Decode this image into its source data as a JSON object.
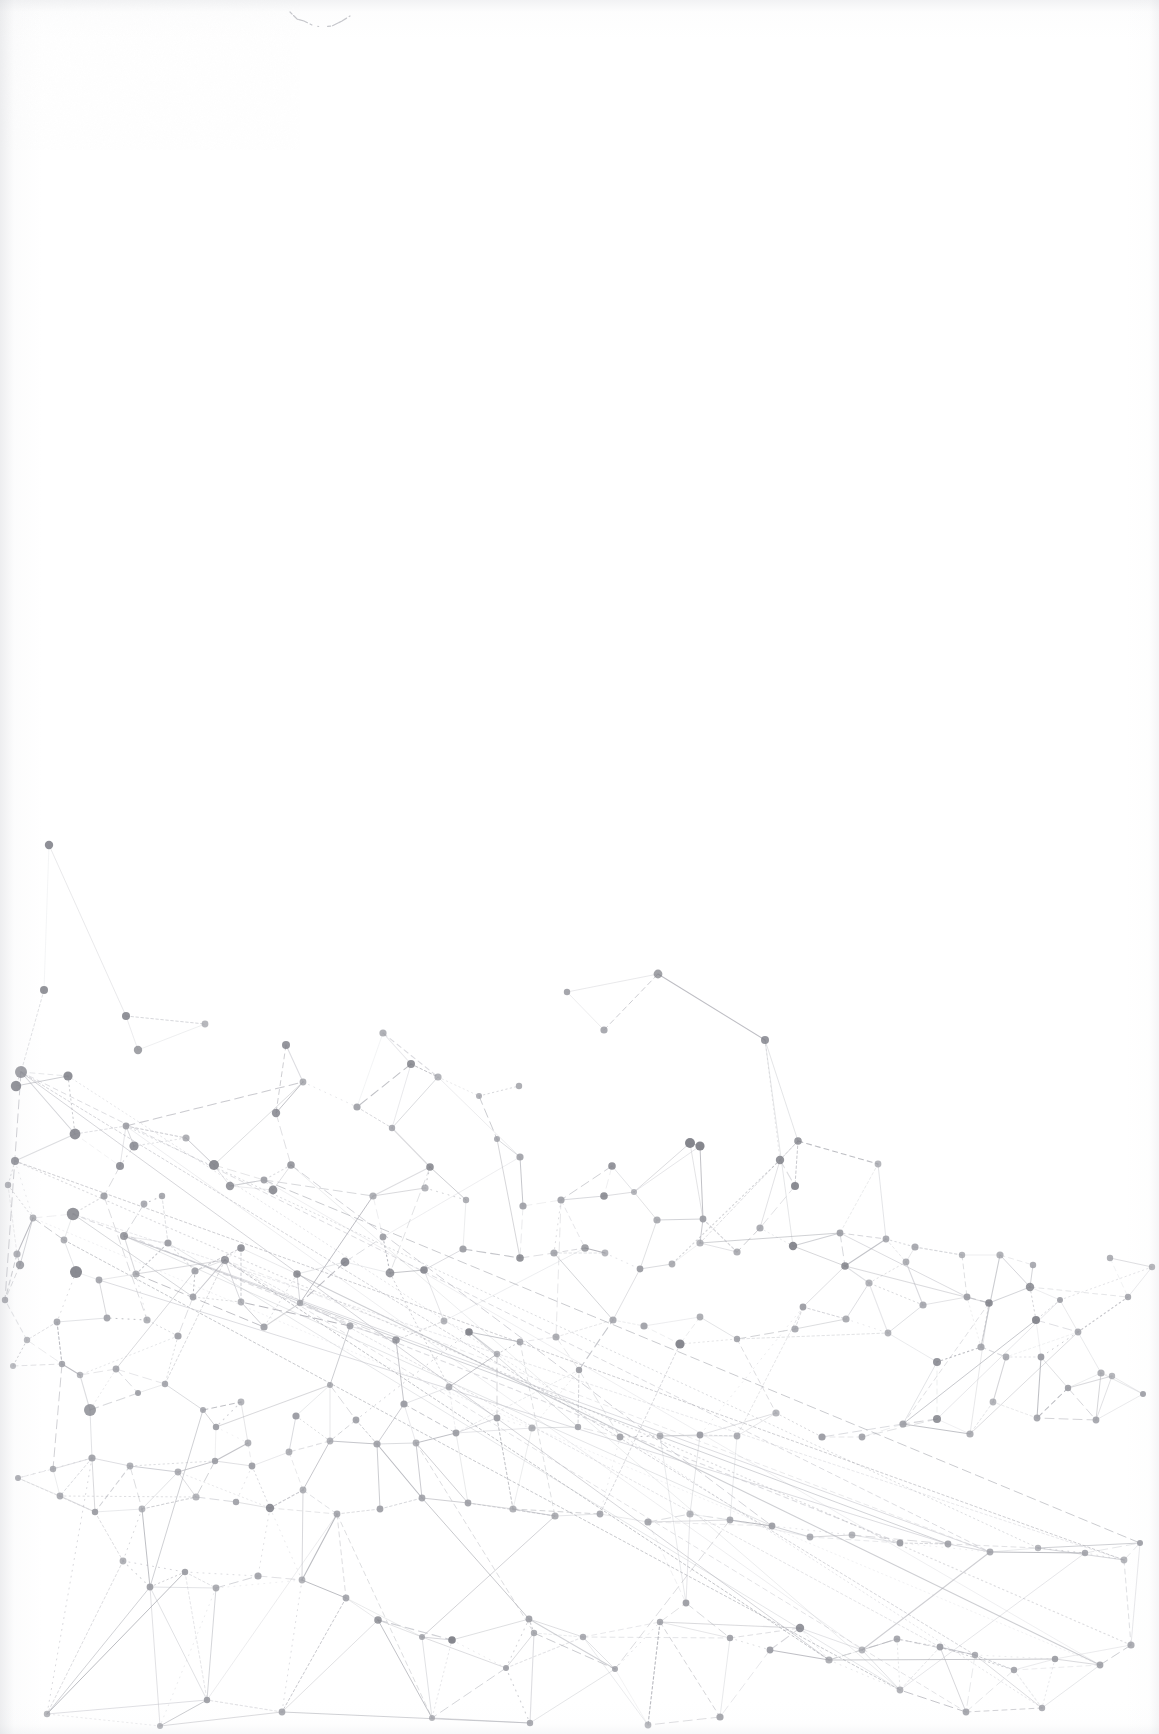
{
  "page": {
    "medium": "scanned-page",
    "width": 1159,
    "height": 1734,
    "background_color": "#ffffff",
    "blank_region_label": "blank upper page area",
    "artwork_region_label": "abstract network graph illustration"
  },
  "artifacts": {
    "pencil_mark": {
      "label": "faint pencil stroke",
      "x": 288,
      "y": 8,
      "width": 64,
      "height": 26,
      "color": "#b9bac0",
      "path": "M2,4 L9,11 L16,13 L24,17 L33,19 L44,18 L54,13 L62,8"
    }
  },
  "chart_data": {
    "type": "scatter",
    "title": "",
    "subtitle": "",
    "xlabel": "",
    "ylabel": "",
    "grid": false,
    "legend": null,
    "annotations": [],
    "xlim": [
      0,
      1159
    ],
    "ylim": [
      0,
      1734
    ],
    "style": {
      "node_color": "#7e7f87",
      "node_color_light": "#9b9ca3",
      "edge_color": "#a9aab1",
      "edge_color_light": "#c4c5cb",
      "edge_width": 0.8,
      "background": "#ffffff"
    },
    "counts": {
      "nodes": 212,
      "edges": 332
    },
    "nodes": [
      [
        49,
        845,
        4.2
      ],
      [
        44,
        990,
        4.0
      ],
      [
        126,
        1016,
        4.0
      ],
      [
        205,
        1024,
        3.4
      ],
      [
        138,
        1050,
        4.2
      ],
      [
        21,
        1072,
        6.0
      ],
      [
        68,
        1076,
        4.6
      ],
      [
        16,
        1086,
        5.2
      ],
      [
        286,
        1045,
        4.0
      ],
      [
        383,
        1033,
        3.6
      ],
      [
        411,
        1064,
        4.0
      ],
      [
        75,
        1134,
        5.4
      ],
      [
        126,
        1126,
        3.4
      ],
      [
        134,
        1146,
        4.6
      ],
      [
        276,
        1113,
        4.2
      ],
      [
        303,
        1082,
        3.4
      ],
      [
        357,
        1107,
        3.6
      ],
      [
        392,
        1128,
        3.2
      ],
      [
        438,
        1077,
        3.6
      ],
      [
        479,
        1096,
        3.0
      ],
      [
        519,
        1086,
        3.2
      ],
      [
        604,
        1030,
        3.6
      ],
      [
        567,
        992,
        3.2
      ],
      [
        658,
        974,
        4.4
      ],
      [
        765,
        1040,
        4.0
      ],
      [
        690,
        1143,
        5.0
      ],
      [
        700,
        1146,
        4.6
      ],
      [
        780,
        1160,
        4.2
      ],
      [
        798,
        1141,
        3.8
      ],
      [
        878,
        1164,
        3.4
      ],
      [
        795,
        1186,
        4.0
      ],
      [
        612,
        1166,
        3.8
      ],
      [
        520,
        1157,
        3.6
      ],
      [
        497,
        1139,
        3.0
      ],
      [
        430,
        1167,
        3.8
      ],
      [
        291,
        1165,
        3.8
      ],
      [
        214,
        1165,
        5.0
      ],
      [
        186,
        1138,
        3.6
      ],
      [
        120,
        1166,
        4.0
      ],
      [
        15,
        1161,
        4.0
      ],
      [
        8,
        1185,
        3.2
      ],
      [
        33,
        1218,
        3.4
      ],
      [
        73,
        1214,
        6.2
      ],
      [
        104,
        1196,
        3.6
      ],
      [
        144,
        1204,
        3.4
      ],
      [
        162,
        1196,
        3.2
      ],
      [
        230,
        1186,
        4.2
      ],
      [
        264,
        1180,
        3.4
      ],
      [
        273,
        1190,
        4.4
      ],
      [
        373,
        1196,
        3.6
      ],
      [
        425,
        1188,
        3.6
      ],
      [
        466,
        1200,
        3.2
      ],
      [
        523,
        1206,
        3.6
      ],
      [
        561,
        1200,
        3.6
      ],
      [
        604,
        1196,
        3.8
      ],
      [
        634,
        1192,
        3.0
      ],
      [
        657,
        1220,
        3.6
      ],
      [
        703,
        1219,
        3.4
      ],
      [
        760,
        1228,
        3.6
      ],
      [
        793,
        1246,
        4.2
      ],
      [
        840,
        1233,
        3.4
      ],
      [
        886,
        1239,
        3.4
      ],
      [
        915,
        1247,
        3.6
      ],
      [
        962,
        1255,
        3.2
      ],
      [
        1000,
        1255,
        3.6
      ],
      [
        1033,
        1265,
        3.2
      ],
      [
        1030,
        1287,
        4.2
      ],
      [
        1060,
        1300,
        3.0
      ],
      [
        1110,
        1258,
        3.2
      ],
      [
        1036,
        1320,
        4.0
      ],
      [
        1101,
        1373,
        3.6
      ],
      [
        1152,
        1267,
        3.2
      ],
      [
        1128,
        1297,
        3.2
      ],
      [
        1078,
        1332,
        3.4
      ],
      [
        989,
        1303,
        3.8
      ],
      [
        967,
        1297,
        3.4
      ],
      [
        923,
        1305,
        3.6
      ],
      [
        869,
        1283,
        3.6
      ],
      [
        845,
        1266,
        3.8
      ],
      [
        906,
        1262,
        3.4
      ],
      [
        17,
        1254,
        3.6
      ],
      [
        20,
        1265,
        4.2
      ],
      [
        76,
        1272,
        6.0
      ],
      [
        64,
        1240,
        3.4
      ],
      [
        124,
        1236,
        4.0
      ],
      [
        99,
        1280,
        3.4
      ],
      [
        136,
        1274,
        3.6
      ],
      [
        168,
        1243,
        3.6
      ],
      [
        195,
        1271,
        3.6
      ],
      [
        225,
        1260,
        4.0
      ],
      [
        241,
        1248,
        3.8
      ],
      [
        297,
        1274,
        3.8
      ],
      [
        345,
        1262,
        4.4
      ],
      [
        383,
        1237,
        3.4
      ],
      [
        390,
        1273,
        4.4
      ],
      [
        424,
        1270,
        3.8
      ],
      [
        463,
        1249,
        3.6
      ],
      [
        520,
        1258,
        3.8
      ],
      [
        554,
        1253,
        3.6
      ],
      [
        585,
        1248,
        3.8
      ],
      [
        605,
        1253,
        3.4
      ],
      [
        640,
        1269,
        3.4
      ],
      [
        672,
        1264,
        3.4
      ],
      [
        700,
        1243,
        3.6
      ],
      [
        737,
        1252,
        3.6
      ],
      [
        350,
        1326,
        3.4
      ],
      [
        396,
        1340,
        3.8
      ],
      [
        444,
        1321,
        3.4
      ],
      [
        300,
        1303,
        3.2
      ],
      [
        264,
        1327,
        3.6
      ],
      [
        241,
        1302,
        3.4
      ],
      [
        193,
        1297,
        3.4
      ],
      [
        178,
        1336,
        3.6
      ],
      [
        147,
        1320,
        3.6
      ],
      [
        107,
        1318,
        3.4
      ],
      [
        57,
        1322,
        3.4
      ],
      [
        27,
        1340,
        3.2
      ],
      [
        5,
        1300,
        3.2
      ],
      [
        13,
        1366,
        3.0
      ],
      [
        62,
        1364,
        3.2
      ],
      [
        80,
        1375,
        3.2
      ],
      [
        116,
        1369,
        3.4
      ],
      [
        90,
        1410,
        6.0
      ],
      [
        138,
        1393,
        3.0
      ],
      [
        165,
        1384,
        3.2
      ],
      [
        203,
        1410,
        3.0
      ],
      [
        241,
        1402,
        3.4
      ],
      [
        216,
        1427,
        3.2
      ],
      [
        248,
        1443,
        3.4
      ],
      [
        330,
        1385,
        3.0
      ],
      [
        296,
        1416,
        3.6
      ],
      [
        356,
        1420,
        3.4
      ],
      [
        404,
        1404,
        3.6
      ],
      [
        449,
        1387,
        3.4
      ],
      [
        469,
        1332,
        3.8
      ],
      [
        497,
        1354,
        3.2
      ],
      [
        520,
        1342,
        3.4
      ],
      [
        556,
        1337,
        3.6
      ],
      [
        579,
        1370,
        3.2
      ],
      [
        613,
        1320,
        3.6
      ],
      [
        644,
        1326,
        3.6
      ],
      [
        700,
        1317,
        3.4
      ],
      [
        680,
        1344,
        4.6
      ],
      [
        737,
        1339,
        3.2
      ],
      [
        795,
        1329,
        3.6
      ],
      [
        803,
        1307,
        3.4
      ],
      [
        846,
        1319,
        3.6
      ],
      [
        888,
        1333,
        3.4
      ],
      [
        937,
        1362,
        4.0
      ],
      [
        981,
        1347,
        3.6
      ],
      [
        1006,
        1357,
        3.4
      ],
      [
        1041,
        1357,
        3.4
      ],
      [
        1068,
        1388,
        3.2
      ],
      [
        1112,
        1376,
        3.2
      ],
      [
        1143,
        1394,
        3.0
      ],
      [
        1096,
        1420,
        3.4
      ],
      [
        1037,
        1418,
        3.4
      ],
      [
        993,
        1402,
        3.4
      ],
      [
        970,
        1434,
        3.6
      ],
      [
        937,
        1419,
        4.0
      ],
      [
        903,
        1424,
        3.6
      ],
      [
        862,
        1437,
        3.4
      ],
      [
        822,
        1437,
        3.6
      ],
      [
        776,
        1413,
        3.6
      ],
      [
        737,
        1436,
        3.4
      ],
      [
        700,
        1435,
        3.4
      ],
      [
        660,
        1436,
        3.4
      ],
      [
        620,
        1437,
        3.4
      ],
      [
        578,
        1427,
        3.2
      ],
      [
        532,
        1428,
        3.6
      ],
      [
        497,
        1418,
        3.4
      ],
      [
        456,
        1433,
        3.4
      ],
      [
        416,
        1443,
        3.4
      ],
      [
        377,
        1444,
        3.6
      ],
      [
        330,
        1441,
        3.4
      ],
      [
        289,
        1452,
        3.4
      ],
      [
        252,
        1466,
        3.4
      ],
      [
        215,
        1461,
        3.2
      ],
      [
        178,
        1472,
        3.4
      ],
      [
        130,
        1466,
        3.4
      ],
      [
        92,
        1458,
        3.6
      ],
      [
        53,
        1469,
        3.2
      ],
      [
        18,
        1478,
        3.0
      ],
      [
        60,
        1496,
        3.4
      ],
      [
        95,
        1512,
        3.2
      ],
      [
        142,
        1509,
        3.4
      ],
      [
        196,
        1497,
        3.6
      ],
      [
        236,
        1502,
        3.2
      ],
      [
        270,
        1508,
        4.2
      ],
      [
        303,
        1490,
        3.4
      ],
      [
        337,
        1514,
        3.4
      ],
      [
        380,
        1509,
        3.4
      ],
      [
        422,
        1498,
        3.4
      ],
      [
        468,
        1503,
        3.4
      ],
      [
        513,
        1509,
        3.6
      ],
      [
        555,
        1516,
        3.6
      ],
      [
        600,
        1514,
        3.4
      ],
      [
        648,
        1522,
        3.6
      ],
      [
        690,
        1514,
        3.6
      ],
      [
        730,
        1520,
        3.4
      ],
      [
        772,
        1526,
        3.4
      ],
      [
        810,
        1537,
        3.4
      ],
      [
        852,
        1535,
        3.4
      ],
      [
        900,
        1543,
        3.4
      ],
      [
        948,
        1544,
        3.4
      ],
      [
        990,
        1552,
        3.4
      ],
      [
        1038,
        1548,
        3.2
      ],
      [
        1085,
        1553,
        3.2
      ],
      [
        1124,
        1560,
        3.4
      ],
      [
        1140,
        1543,
        3.0
      ],
      [
        123,
        1561,
        3.4
      ],
      [
        150,
        1587,
        3.4
      ],
      [
        185,
        1572,
        3.2
      ],
      [
        216,
        1588,
        3.4
      ],
      [
        258,
        1576,
        3.6
      ],
      [
        302,
        1580,
        3.4
      ],
      [
        346,
        1598,
        3.4
      ],
      [
        378,
        1620,
        3.8
      ],
      [
        422,
        1637,
        3.0
      ],
      [
        452,
        1640,
        3.8
      ],
      [
        506,
        1668,
        3.0
      ],
      [
        534,
        1633,
        3.2
      ],
      [
        583,
        1637,
        3.2
      ],
      [
        529,
        1619,
        3.4
      ],
      [
        615,
        1669,
        3.0
      ],
      [
        660,
        1622,
        3.2
      ],
      [
        686,
        1603,
        3.4
      ],
      [
        730,
        1638,
        3.2
      ],
      [
        770,
        1650,
        3.4
      ],
      [
        800,
        1628,
        4.2
      ],
      [
        829,
        1660,
        3.6
      ],
      [
        862,
        1650,
        3.4
      ],
      [
        897,
        1639,
        3.4
      ],
      [
        940,
        1647,
        3.4
      ],
      [
        975,
        1655,
        3.2
      ],
      [
        1014,
        1670,
        3.2
      ],
      [
        1055,
        1659,
        3.2
      ],
      [
        1100,
        1665,
        3.4
      ],
      [
        1131,
        1645,
        3.6
      ],
      [
        720,
        1717,
        3.6
      ],
      [
        648,
        1725,
        3.4
      ],
      [
        530,
        1723,
        3.2
      ],
      [
        432,
        1718,
        3.0
      ],
      [
        282,
        1712,
        3.4
      ],
      [
        207,
        1700,
        3.2
      ],
      [
        160,
        1726,
        3.0
      ],
      [
        47,
        1714,
        3.2
      ],
      [
        966,
        1712,
        3.4
      ],
      [
        1042,
        1708,
        3.2
      ],
      [
        900,
        1690,
        3.4
      ]
    ],
    "edge_style_mix": [
      "solid",
      "dashed",
      "dotted"
    ]
  }
}
